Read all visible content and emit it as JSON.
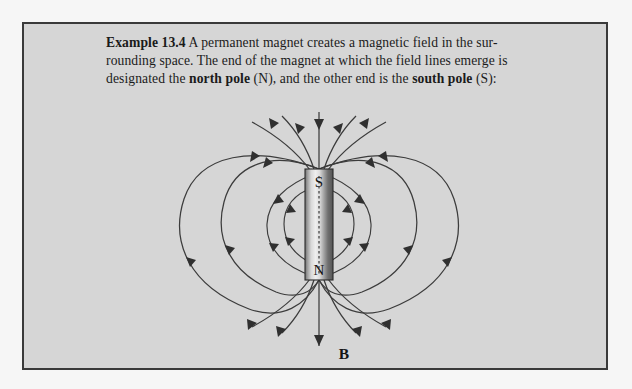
{
  "figure": {
    "caption": {
      "example_label": "Example 13.4",
      "text_part_1": "A permanent magnet creates a magnetic field in the sur-rounding space. The end of the magnet at which the field lines emerge is designated the ",
      "bold_north": "north pole",
      "text_part_2": " (N), and the other end is the ",
      "bold_south": "south pole",
      "text_part_3": " (S):"
    },
    "diagram": {
      "type": "magnetic-field-lines",
      "magnet": {
        "top_pole_label": "S",
        "bottom_pole_label": "N",
        "orientation": "vertical",
        "center_x": 317,
        "top_y": 167,
        "bottom_y": 278,
        "left_x": 303,
        "right_x": 331
      },
      "field_label": "B",
      "field_label_x": 320,
      "field_label_y": 352,
      "loop_count_per_side": 4,
      "vertical_axis_line": true
    },
    "colors": {
      "page_background": "#f6f6f6",
      "panel_background": "#d6d6d6",
      "border": "#3a3a3a",
      "line": "#3c3c3c",
      "text": "#1b1b1b",
      "magnet_light": "#e8e8e8",
      "magnet_dark": "#6f6f6f"
    }
  }
}
